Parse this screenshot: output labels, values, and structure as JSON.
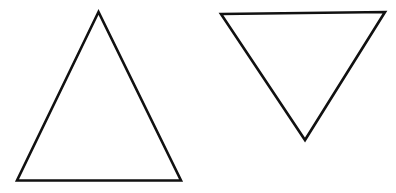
{
  "diagram": {
    "background": "#ffffff",
    "stroke_color": "#111111",
    "stroke_width": 2.6,
    "shapes": [
      {
        "name": "upright-triangle",
        "orientation": "pointing-up",
        "points": "98.5,12 17,180.5 181,180.5"
      },
      {
        "name": "inverted-triangle",
        "orientation": "pointing-down",
        "points": "221,14 385,12 305,140"
      }
    ]
  }
}
